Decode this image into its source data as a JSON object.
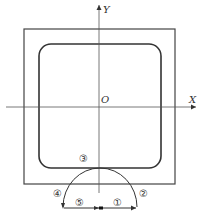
{
  "diagram": {
    "axes": {
      "x_label": "X",
      "y_label": "Y",
      "origin_label": "O"
    },
    "path_labels": {
      "p1": "①",
      "p2": "②",
      "p3": "③",
      "p4": "④",
      "p5": "⑤"
    },
    "colors": {
      "line": "#333333",
      "axis": "#444444",
      "background": "#ffffff"
    }
  }
}
